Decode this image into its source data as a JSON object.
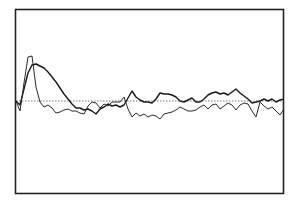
{
  "chart_data": {
    "type": "line",
    "title": "",
    "xlabel": "",
    "ylabel": "",
    "grid": false,
    "legend": null,
    "baseline": {
      "value": 0,
      "style": "dotted"
    },
    "xlim": [
      0,
      268
    ],
    "ylim": [
      -92,
      92
    ],
    "x": [
      0,
      4,
      8,
      12,
      16,
      20,
      24,
      28,
      32,
      36,
      40,
      44,
      48,
      52,
      56,
      60,
      64,
      68,
      72,
      76,
      80,
      84,
      88,
      92,
      96,
      100,
      104,
      108,
      112,
      116,
      120,
      124,
      128,
      132,
      136,
      140,
      144,
      148,
      152,
      156,
      160,
      164,
      168,
      172,
      176,
      180,
      184,
      188,
      192,
      196,
      200,
      204,
      208,
      212,
      216,
      220,
      224,
      228,
      232,
      236,
      240,
      244,
      248,
      252,
      256,
      260,
      264,
      268
    ],
    "series": [
      {
        "name": "trace-a",
        "color": "#1a1a1a",
        "values": [
          0,
          -4,
          12,
          28,
          36,
          37,
          35,
          33,
          29,
          24,
          19,
          13,
          7,
          2,
          -3,
          -7,
          -7,
          -9,
          -8,
          -10,
          -13,
          -8,
          -6,
          -3,
          -5,
          -4,
          -6,
          -4,
          3,
          10,
          4,
          1,
          -1,
          -1,
          -2,
          2,
          8,
          7,
          7,
          6,
          4,
          0,
          -1,
          1,
          3,
          -1,
          -1,
          2,
          6,
          8,
          9,
          7,
          8,
          6,
          9,
          12,
          8,
          5,
          2,
          -2,
          -1,
          0,
          2,
          0,
          2,
          -1,
          1,
          2
        ]
      },
      {
        "name": "trace-b",
        "color": "#2a2a2a",
        "values": [
          0,
          -10,
          18,
          44,
          45,
          14,
          -1,
          -6,
          -4,
          -7,
          -12,
          -11,
          -9,
          -8,
          -10,
          -10,
          -12,
          -13,
          -5,
          -1,
          -2,
          -7,
          -3,
          -5,
          -1,
          -1,
          -1,
          4,
          -8,
          -16,
          -12,
          -15,
          -13,
          -16,
          -14,
          -15,
          -18,
          -13,
          -12,
          -11,
          -9,
          -6,
          -8,
          -10,
          -10,
          -9,
          -6,
          -4,
          -8,
          -4,
          -3,
          -8,
          -5,
          -2,
          -4,
          -9,
          -4,
          -2,
          -3,
          -10,
          -16,
          -1,
          -5,
          -8,
          -6,
          -10,
          -14,
          -8
        ]
      }
    ]
  }
}
